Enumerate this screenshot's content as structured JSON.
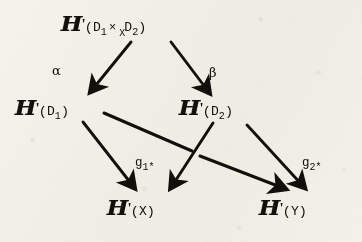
{
  "figure": {
    "kind": "commutative-diagram",
    "medium": "scanned printed page",
    "background_color": "#f1eee7",
    "ink_color": "#14110e",
    "functor_symbol": "H",
    "prime": "'"
  },
  "nodes": [
    {
      "id": "top",
      "name": "node-H-prime-D1-times-X-D2",
      "head": "H",
      "prime": "'",
      "open_paren": "(",
      "arg1": "D",
      "arg1_sub": "1",
      "operator": "×",
      "operator_sub": "X",
      "arg2": "D",
      "arg2_sub": "2",
      "close_paren": ")",
      "plain": "H'(D1 ×_X D2)"
    },
    {
      "id": "mid_left",
      "name": "node-H-prime-D1",
      "head": "H",
      "prime": "'",
      "open_paren": "(",
      "arg1": "D",
      "arg1_sub": "1",
      "close_paren": ")",
      "plain": "H'(D1)"
    },
    {
      "id": "mid_right",
      "name": "node-H-prime-D2",
      "head": "H",
      "prime": "'",
      "open_paren": "(",
      "arg1": "D",
      "arg1_sub": "2",
      "close_paren": ")",
      "plain": "H'(D2)"
    },
    {
      "id": "bot_left",
      "name": "node-H-prime-X",
      "head": "H",
      "prime": "'",
      "open_paren": "(",
      "arg1": "X",
      "arg1_sub": "",
      "close_paren": ")",
      "plain": "H'(X)"
    },
    {
      "id": "bot_right",
      "name": "node-H-prime-Y",
      "head": "H",
      "prime": "'",
      "open_paren": "(",
      "arg1": "Y",
      "arg1_sub": "",
      "close_paren": ")",
      "plain": "H'(Y)"
    }
  ],
  "edge_labels": {
    "alpha": "α",
    "beta": "β",
    "g1": {
      "letter": "g",
      "sub": "1",
      "star": "*",
      "plain": "g1*"
    },
    "g2": {
      "letter": "g",
      "sub": "2",
      "star": "*",
      "plain": "g2*"
    }
  },
  "edges": [
    {
      "name": "edge-top-to-D1",
      "from": "top",
      "to": "mid_left",
      "label": "α"
    },
    {
      "name": "edge-top-to-D2",
      "from": "top",
      "to": "mid_right",
      "label": "β"
    },
    {
      "name": "edge-D1-to-X",
      "from": "mid_left",
      "to": "bot_left",
      "label": ""
    },
    {
      "name": "edge-D1-to-Y",
      "from": "mid_left",
      "to": "bot_right",
      "label": "g1*"
    },
    {
      "name": "edge-D2-to-X",
      "from": "mid_right",
      "to": "bot_left",
      "label": ""
    },
    {
      "name": "edge-D2-to-Y",
      "from": "mid_right",
      "to": "bot_right",
      "label": "g2*"
    }
  ]
}
